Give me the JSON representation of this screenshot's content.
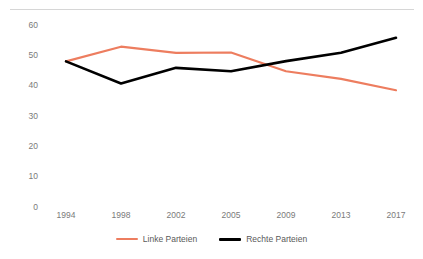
{
  "chart_data": {
    "type": "line",
    "title": "",
    "xlabel": "",
    "ylabel": "",
    "categories": [
      "1994",
      "1998",
      "2002",
      "2005",
      "2009",
      "2013",
      "2017"
    ],
    "ylim": [
      0,
      60
    ],
    "yticks": [
      "0",
      "10",
      "20",
      "30",
      "40",
      "50",
      "60"
    ],
    "grid": false,
    "legend_position": "bottom",
    "series": [
      {
        "name": "Linke Parteien",
        "color": "#ED7D5F",
        "values": [
          47.8,
          52.6,
          50.6,
          50.7,
          44.6,
          42.1,
          38.4
        ]
      },
      {
        "name": "Rechte Parteien",
        "color": "#000000",
        "values": [
          47.8,
          40.6,
          45.7,
          44.6,
          47.9,
          50.6,
          55.5
        ]
      }
    ]
  }
}
